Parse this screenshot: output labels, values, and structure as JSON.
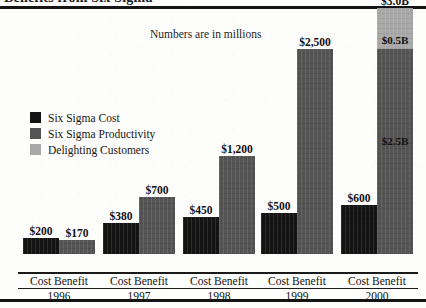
{
  "document": {
    "title": "Benefits from Six Sigma",
    "subtitle": "Numbers are in millions"
  },
  "legend": {
    "items": [
      {
        "label": "Six Sigma Cost",
        "color": "#141414"
      },
      {
        "label": "Six Sigma Productivity",
        "color": "#545454"
      },
      {
        "label": "Delighting Customers",
        "color": "#a8a8a8"
      }
    ]
  },
  "axis": {
    "cost_label": "Cost",
    "benefit_label": "Benefit",
    "cost_benefit_label": "Cost Benefit"
  },
  "chart_data": {
    "type": "bar",
    "title": "Benefits from Six Sigma",
    "subtitle": "Numbers are in millions",
    "xlabel": "Cost Benefit",
    "ylabel": "",
    "ylim": [
      0,
      3000
    ],
    "grid": false,
    "legend_position": "inside-left",
    "categories": [
      "1996",
      "1997",
      "1998",
      "1999",
      "2000"
    ],
    "series": [
      {
        "name": "Six Sigma Cost",
        "color": "#141414",
        "values": [
          200,
          380,
          450,
          500,
          600
        ],
        "labels": [
          "$200",
          "$380",
          "$450",
          "$500",
          "$600"
        ]
      },
      {
        "name": "Six Sigma Productivity",
        "color": "#545454",
        "values": [
          170,
          700,
          1200,
          2500,
          2500
        ],
        "labels": [
          "$170",
          "$700",
          "$1,200",
          "$2,500",
          "$2.5B"
        ]
      },
      {
        "name": "Delighting Customers",
        "color": "#a8a8a8",
        "values": [
          0,
          0,
          0,
          0,
          500
        ],
        "labels": [
          "",
          "",
          "",
          "",
          "$0.5B"
        ]
      }
    ],
    "benefit_totals": [
      170,
      700,
      1200,
      2500,
      3000
    ],
    "benefit_total_labels": [
      "$170",
      "$700",
      "$1,200",
      "$2,500",
      "$3.0B"
    ],
    "annotations": [
      {
        "text": "$3.0B",
        "position": "above 2000 benefit bar"
      },
      {
        "text": "$0.5B",
        "position": "inside 2000 delighting-customers segment"
      },
      {
        "text": "$2.5B",
        "position": "inside 2000 productivity segment"
      }
    ]
  }
}
